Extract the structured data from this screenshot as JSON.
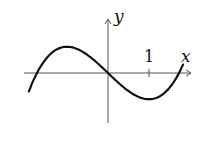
{
  "chart_data": {
    "type": "line",
    "title": "",
    "xlabel": "x",
    "ylabel": "y",
    "x_ticks": [
      {
        "value": 1,
        "label": "1"
      }
    ],
    "y_ticks": [],
    "grid": false,
    "legend": null,
    "xlim": [
      -1.9,
      1.9
    ],
    "ylim": [
      -1.25,
      1.3
    ],
    "series": [
      {
        "name": "curve",
        "function": "y ≈ 0.32(x^3 - 3x)",
        "x": [
          -1.93,
          -1.73,
          -1.5,
          -1.0,
          -0.5,
          0,
          0.5,
          1.0,
          1.5,
          1.73,
          1.83
        ],
        "y": [
          -0.42,
          0.0,
          0.36,
          0.64,
          0.44,
          0.0,
          -0.44,
          -0.64,
          -0.36,
          0.0,
          0.17
        ]
      }
    ],
    "annotations": [
      {
        "text": "x",
        "position": "x-axis end"
      },
      {
        "text": "y",
        "position": "y-axis end"
      },
      {
        "text": "1",
        "position": "tick above x=1"
      }
    ]
  },
  "labels": {
    "x_axis": "x",
    "y_axis": "y",
    "tick_one": "1"
  }
}
